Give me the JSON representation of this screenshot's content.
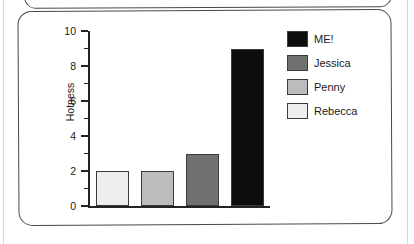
{
  "page": {
    "background_color": "#ffffff",
    "edge_line_color": "#d8d8d8"
  },
  "card": {
    "border_color": "#4a4a4a",
    "background_color": "#ffffff"
  },
  "chart_data": {
    "type": "bar",
    "title": "",
    "xlabel": "",
    "ylabel": "Hotness",
    "ylim": [
      0,
      10
    ],
    "ytick_labels": [
      "0",
      "2",
      "4",
      "6",
      "8",
      "10"
    ],
    "ytick_values": [
      0,
      2,
      4,
      6,
      8,
      10
    ],
    "minor_ticks": [
      1,
      3,
      5,
      7,
      9
    ],
    "grid": false,
    "legend_position": "top-right",
    "categories": [
      "Rebecca",
      "Penny",
      "Jessica",
      "ME!"
    ],
    "values": [
      2,
      2,
      3,
      9
    ],
    "bar_colors": [
      "#ededed",
      "#bcbcbc",
      "#707070",
      "#0d0d0d"
    ],
    "bar_edge_color": "#3a3a3a",
    "legend": [
      {
        "label": "ME!",
        "color": "#0d0d0d"
      },
      {
        "label": "Jessica",
        "color": "#707070"
      },
      {
        "label": "Penny",
        "color": "#bcbcbc"
      },
      {
        "label": "Rebecca",
        "color": "#ededed"
      }
    ]
  }
}
